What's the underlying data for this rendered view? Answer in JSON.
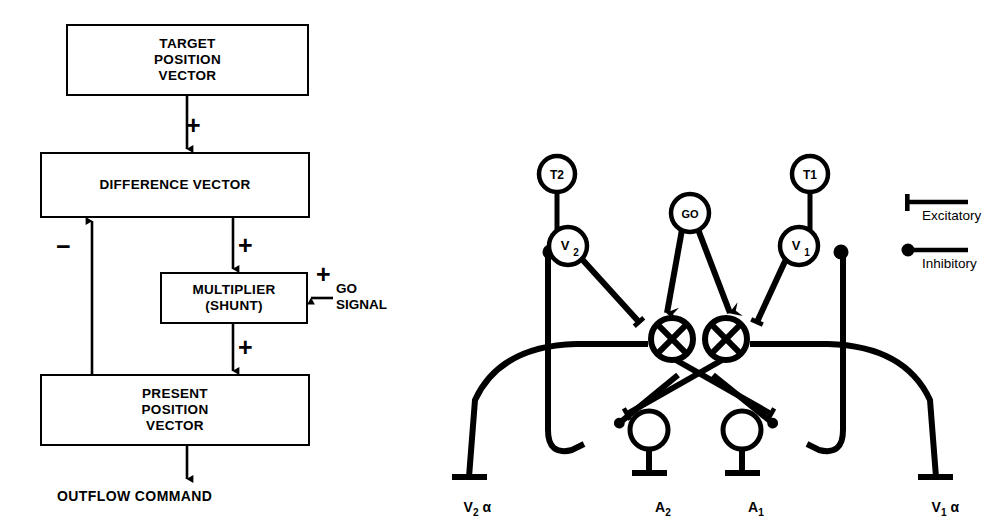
{
  "figure": {
    "background": "#ffffff",
    "ink": "#000000"
  },
  "flowchart": {
    "boxes": [
      {
        "id": "target",
        "label": "TARGET\nPOSITION\nVECTOR"
      },
      {
        "id": "difference",
        "label": "DIFFERENCE VECTOR"
      },
      {
        "id": "multiplier",
        "label": "MULTIPLIER\n(SHUNT)"
      },
      {
        "id": "present",
        "label": "PRESENT\nPOSITION\nVECTOR"
      }
    ],
    "signs": {
      "target_to_difference": "+",
      "difference_to_multiplier": "+",
      "go_into_multiplier": "+",
      "multiplier_to_present": "+",
      "present_to_difference": "−"
    },
    "go_signal_label": "GO\nSIGNAL",
    "output_label": "OUTFLOW COMMAND"
  },
  "circuit": {
    "nodes": [
      {
        "id": "T2",
        "label": "T2"
      },
      {
        "id": "T1",
        "label": "T1"
      },
      {
        "id": "GO",
        "label": "GO"
      },
      {
        "id": "V2",
        "label": "V",
        "sub": "2"
      },
      {
        "id": "V1",
        "label": "V",
        "sub": "1"
      },
      {
        "id": "M2",
        "label": "⊗"
      },
      {
        "id": "M1",
        "label": "⊗"
      },
      {
        "id": "A2",
        "label": ""
      },
      {
        "id": "A1",
        "label": ""
      }
    ],
    "terminal_labels": [
      {
        "id": "v2alpha",
        "text": "V",
        "sub": "2",
        "suffix": "α"
      },
      {
        "id": "a2",
        "text": "A",
        "sub": "2",
        "suffix": ""
      },
      {
        "id": "a1",
        "text": "A",
        "sub": "1",
        "suffix": ""
      },
      {
        "id": "v1alpha",
        "text": "V",
        "sub": "1",
        "suffix": "α"
      }
    ],
    "legend": {
      "excitatory_label": "Excitatory",
      "inhibitory_label": "Inhibitory"
    }
  }
}
